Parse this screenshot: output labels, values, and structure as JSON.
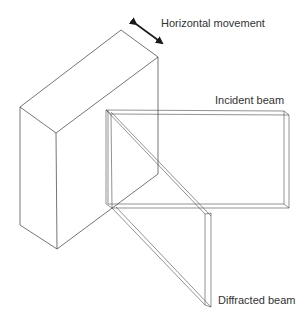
{
  "diagram": {
    "labels": {
      "movement": "Horizontal movement",
      "incident": "Incident beam",
      "diffracted": "Diffracted beam"
    },
    "colors": {
      "line": "#3a3a3a",
      "text": "#333333",
      "background": "#ffffff"
    }
  }
}
